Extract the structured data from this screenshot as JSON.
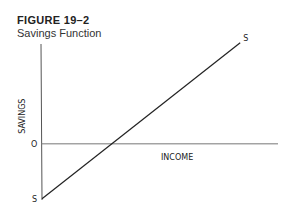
{
  "figure": {
    "number": "FIGURE 19–2",
    "title": "Savings Function"
  },
  "chart_data": {
    "type": "line",
    "title": "Savings Function",
    "xlabel": "INCOME",
    "ylabel": "SAVINGS",
    "origin_label": "O",
    "xlim": [
      0,
      1
    ],
    "ylim": [
      -0.45,
      0.8
    ],
    "grid": false,
    "series": [
      {
        "name": "S",
        "start_label": "S",
        "end_label": "S",
        "x": [
          0,
          0.83
        ],
        "y": [
          -0.44,
          0.81
        ]
      }
    ]
  }
}
